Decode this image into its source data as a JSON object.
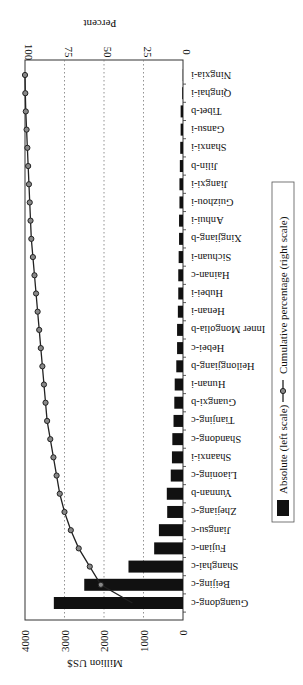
{
  "chart_data": {
    "type": "bar",
    "orientation": "rotated 90 degrees (horizontal bars, text rotated)",
    "title": "",
    "categories": [
      "Guangdong-c",
      "Beijing-c",
      "Shanghai-c",
      "Fujian-c",
      "Jiangsu-c",
      "Zhejiang-c",
      "Yunnan-b",
      "Liaoning-c",
      "Shaanxi-i",
      "Shandong-c",
      "Tianjing-c",
      "Guangxi-b",
      "Hunan-i",
      "Heilongjiang-b",
      "Hebei-c",
      "Inner Mongolia-b",
      "Henan-i",
      "Hubei-i",
      "Hainan-c",
      "Sichuan-i",
      "Xingjiang-b",
      "Anhui-i",
      "Guizhou-i",
      "Jiangxi-i",
      "Jilin-b",
      "Shanxi-i",
      "Gansu-i",
      "Tibet-b",
      "Qinghai-i",
      "Ningxia-i"
    ],
    "series": [
      {
        "name": "Absolute (left scale)",
        "type": "bar",
        "axis": "left",
        "values": [
          3270,
          2500,
          1380,
          730,
          610,
          400,
          410,
          310,
          280,
          270,
          240,
          220,
          210,
          170,
          150,
          150,
          130,
          120,
          120,
          110,
          100,
          100,
          90,
          90,
          80,
          70,
          60,
          60,
          20,
          5
        ]
      },
      {
        "name": "Cumulative percentage (right scale)",
        "type": "line",
        "axis": "right",
        "values": [
          32,
          52,
          59,
          66,
          71,
          75,
          78,
          80,
          82,
          84,
          86,
          87,
          88,
          89,
          90,
          91,
          92,
          93,
          94,
          95,
          96,
          96.5,
          97,
          97.5,
          98,
          98.5,
          99,
          99.5,
          99.8,
          100
        ]
      }
    ],
    "ylabel_left": "Million US$",
    "ylim_left": [
      0,
      4000
    ],
    "yticks_left": [
      "0",
      "1000",
      "2000",
      "3000",
      "4000"
    ],
    "ylabel_right": "Percent",
    "ylim_right": [
      0,
      100
    ],
    "yticks_right": [
      "0",
      "25",
      "50",
      "75",
      "100"
    ],
    "grid": "dotted at 1000/2000/3000 (25/50/75 %)",
    "legend": {
      "position": "right side (bottom in unrotated frame)",
      "entries": [
        "Absolute (left scale)",
        "Cumulative percentage (right scale)"
      ]
    }
  }
}
